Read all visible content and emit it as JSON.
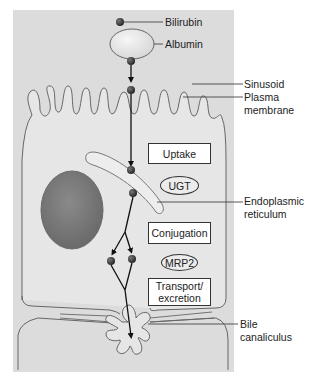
{
  "figure": {
    "type": "biological pathway diagram",
    "colors": {
      "background_panel": "#dcdcdc",
      "cell_fill": "#e6e6e6",
      "outline": "#666666",
      "nucleus": "#7a7a7a",
      "molecule": "#333333",
      "arrow": "#111111"
    }
  },
  "labels": {
    "bilirubin": "Bilirubin",
    "albumin": "Albumin",
    "sinusoid": "Sinusoid",
    "plasma_membrane_1": "Plasma",
    "plasma_membrane_2": "membrane",
    "er_1": "Endoplasmic",
    "er_2": "reticulum",
    "bile_1": "Bile",
    "bile_2": "canaliculus"
  },
  "steps": {
    "uptake": "Uptake",
    "ugt": "UGT",
    "conjugation": "Conjugation",
    "mrp2": "MRP2",
    "transport_1": "Transport/",
    "transport_2": "excretion"
  }
}
